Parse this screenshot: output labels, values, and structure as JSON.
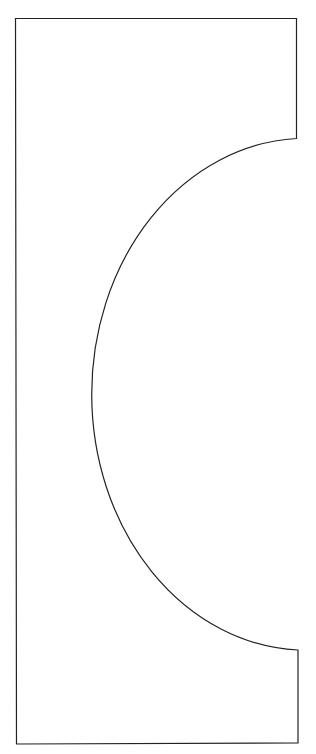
{
  "diagram": {
    "type": "outline-shape",
    "stroke_color": "#222222",
    "fill_color": "#ffffff",
    "background": "#ffffff",
    "outline": {
      "top_left": [
        15,
        18
      ],
      "top_right": [
        296,
        18
      ],
      "arc_start": [
        296,
        138
      ],
      "arc_leftmost": [
        82,
        393
      ],
      "arc_end": [
        298,
        650
      ],
      "bottom_right": [
        298,
        743
      ],
      "bottom_left": [
        17,
        744
      ]
    }
  }
}
